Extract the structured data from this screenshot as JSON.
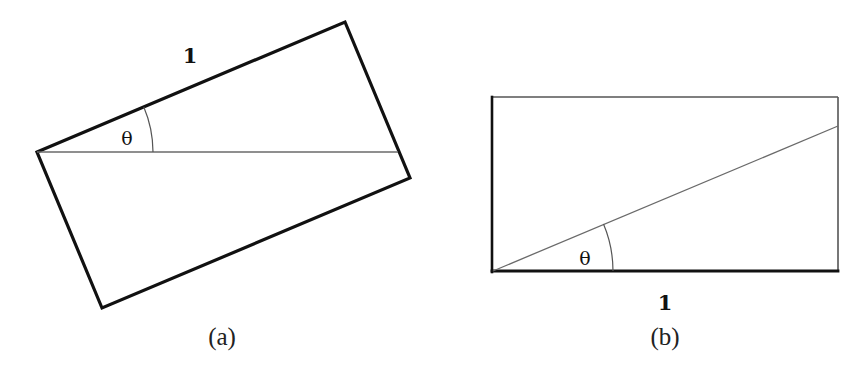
{
  "figure": {
    "panels": [
      {
        "id": "a",
        "caption": "(a)",
        "side_label": "1",
        "angle_label": "θ",
        "description": "Rectangle rotated by angle θ; top edge of length 1, horizontal diagonal chord"
      },
      {
        "id": "b",
        "caption": "(b)",
        "side_label": "1",
        "angle_label": "θ",
        "description": "Axis-aligned rectangle with bottom edge of length 1 and a line from bottom-left corner at angle θ"
      }
    ]
  },
  "colors": {
    "stroke": "#111111",
    "thin_line": "#6a6a6a",
    "background": "#ffffff"
  }
}
